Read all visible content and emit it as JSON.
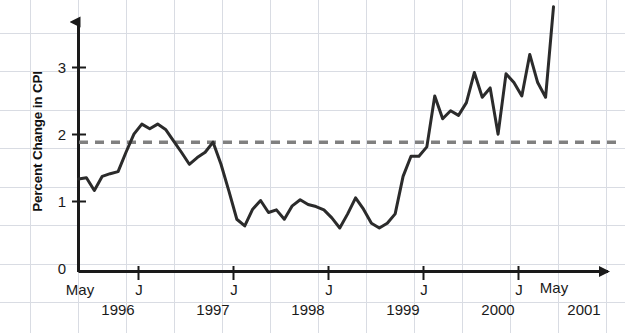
{
  "chart_data": {
    "type": "line",
    "title": "",
    "xlabel": "",
    "ylabel": "Percent Change in CPI",
    "ylim": [
      0,
      4.05
    ],
    "yticks": [
      0,
      1,
      2,
      3
    ],
    "ytick_labels": [
      "0",
      "1",
      "2",
      "3"
    ],
    "grid": true,
    "legend": null,
    "x_start_label": "May",
    "x_end_label": "May",
    "x_tick_label": "J",
    "x_axis_ticks": [
      {
        "label": "May",
        "year": "1996"
      },
      {
        "label": "J",
        "year": "1997"
      },
      {
        "label": "J",
        "year": "1998"
      },
      {
        "label": "J",
        "year": "1999"
      },
      {
        "label": "J",
        "year": "2000"
      },
      {
        "label": "J",
        "year": "2001"
      },
      {
        "label": "May",
        "year": ""
      }
    ],
    "x_years": [
      "1996",
      "1997",
      "1998",
      "1999",
      "2000",
      "2001"
    ],
    "reference_line": {
      "value": 1.93,
      "style": "dashed",
      "color": "#808080",
      "label": ""
    },
    "series": [
      {
        "name": "Percent Change in CPI",
        "color": "#2b2b2b",
        "x": [
          "1996-05",
          "1996-06",
          "1996-07",
          "1996-08",
          "1996-09",
          "1996-10",
          "1996-11",
          "1996-12",
          "1997-01",
          "1997-02",
          "1997-03",
          "1997-04",
          "1997-05",
          "1997-06",
          "1997-07",
          "1997-08",
          "1997-09",
          "1997-10",
          "1997-11",
          "1997-12",
          "1998-01",
          "1998-02",
          "1998-03",
          "1998-04",
          "1998-05",
          "1998-06",
          "1998-07",
          "1998-08",
          "1998-09",
          "1998-10",
          "1998-11",
          "1998-12",
          "1999-01",
          "1999-02",
          "1999-03",
          "1999-04",
          "1999-05",
          "1999-06",
          "1999-07",
          "1999-08",
          "1999-09",
          "1999-10",
          "1999-11",
          "1999-12",
          "2000-01",
          "2000-02",
          "2000-03",
          "2000-04",
          "2000-05",
          "2000-06",
          "2000-07",
          "2000-08",
          "2000-09",
          "2000-10",
          "2000-11",
          "2000-12",
          "2001-01",
          "2001-02",
          "2001-03",
          "2001-04",
          "2001-05"
        ],
        "values": [
          1.38,
          1.4,
          1.21,
          1.42,
          1.46,
          1.49,
          1.78,
          2.05,
          2.2,
          2.13,
          2.2,
          2.12,
          1.95,
          1.78,
          1.6,
          1.7,
          1.78,
          1.93,
          1.6,
          1.2,
          0.78,
          0.68,
          0.93,
          1.06,
          0.88,
          0.92,
          0.78,
          0.98,
          1.07,
          1.0,
          0.97,
          0.92,
          0.8,
          0.65,
          0.86,
          1.1,
          0.93,
          0.72,
          0.65,
          0.72,
          0.86,
          1.42,
          1.72,
          1.72,
          1.86,
          2.62,
          2.28,
          2.4,
          2.33,
          2.52,
          2.97,
          2.6,
          2.74,
          2.05,
          2.95,
          2.82,
          2.62,
          3.24,
          2.82,
          2.6,
          3.95
        ]
      }
    ]
  }
}
